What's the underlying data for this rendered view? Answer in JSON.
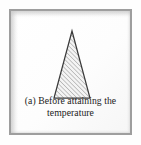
{
  "figure": {
    "label": "(a)",
    "caption_line_1": "(a) Before attaining the",
    "caption_line_2": "temperature",
    "caption_full": "(a) Before attaining the temperature",
    "shape": {
      "name": "triangle",
      "type": "isosceles-triangle",
      "fill_pattern": "diagonal-hatch",
      "outline_color": "#3b3b3b",
      "hatch_color": "#8d8d8d",
      "fill_color": "#f2f2f2"
    },
    "frame": {
      "border_color": "#9e9e9e",
      "background_color": "#fdfdfd"
    },
    "text_color": "#1b1b1b"
  }
}
